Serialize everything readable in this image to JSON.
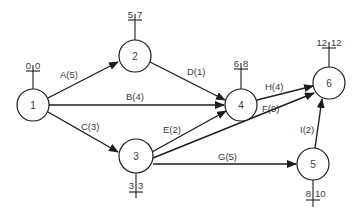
{
  "diagram": {
    "type": "network-activity-on-arrow",
    "nodes": [
      {
        "id": "1",
        "label": "1",
        "cx": 33,
        "cy": 105,
        "r": 16,
        "early": "0",
        "late": "0",
        "tick_dir": "up"
      },
      {
        "id": "2",
        "label": "2",
        "cx": 135,
        "cy": 56,
        "r": 16,
        "early": "5",
        "late": "7",
        "tick_dir": "up"
      },
      {
        "id": "3",
        "label": "3",
        "cx": 136,
        "cy": 156,
        "r": 17,
        "early": "3",
        "late": "3",
        "tick_dir": "down"
      },
      {
        "id": "4",
        "label": "4",
        "cx": 241,
        "cy": 105,
        "r": 16,
        "early": "6",
        "late": "8",
        "tick_dir": "up"
      },
      {
        "id": "5",
        "label": "5",
        "cx": 313,
        "cy": 164,
        "r": 16,
        "early": "8",
        "late": "10",
        "tick_dir": "down"
      },
      {
        "id": "6",
        "label": "6",
        "cx": 329,
        "cy": 83,
        "r": 16,
        "early": "12",
        "late": "12",
        "tick_dir": "up"
      }
    ],
    "edges": [
      {
        "from": "1",
        "to": "2",
        "label": "A(5)",
        "activity": "A",
        "duration": 5
      },
      {
        "from": "1",
        "to": "4",
        "label": "B(4)",
        "activity": "B",
        "duration": 4
      },
      {
        "from": "1",
        "to": "3",
        "label": "C(3)",
        "activity": "C",
        "duration": 3
      },
      {
        "from": "2",
        "to": "4",
        "label": "D(1)",
        "activity": "D",
        "duration": 1
      },
      {
        "from": "3",
        "to": "4",
        "label": "E(2)",
        "activity": "E",
        "duration": 2
      },
      {
        "from": "3",
        "to": "6",
        "label": "F(9)",
        "activity": "F",
        "duration": 9
      },
      {
        "from": "3",
        "to": "5",
        "label": "G(5)",
        "activity": "G",
        "duration": 5
      },
      {
        "from": "4",
        "to": "6",
        "label": "H(4)",
        "activity": "H",
        "duration": 4
      },
      {
        "from": "5",
        "to": "6",
        "label": "I(2)",
        "activity": "I",
        "duration": 2
      }
    ]
  },
  "colors": {
    "line": "#1e1e1e",
    "text": "#3a3a3a",
    "background": "#ffffff"
  }
}
